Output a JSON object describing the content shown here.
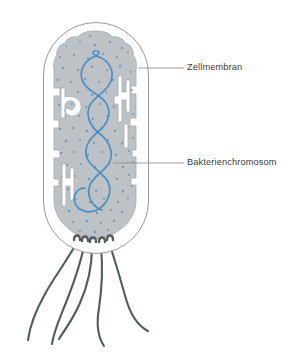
{
  "figure": {
    "type": "biological-diagram",
    "language": "de",
    "background_color": "#ffffff"
  },
  "colors": {
    "background": "#ffffff",
    "cell_wall_stroke": "#9a9a9a",
    "cell_wall_fill": "#ffffff",
    "cytoplasm_fill": "#bcc2c6",
    "cytoplasm_stroke": "#a8aeb2",
    "ribosome_dot": "#7e97ad",
    "membrane_invagination": "#ffffff",
    "membrane_invagination_stroke": "#a8aeb2",
    "chromosome_stroke": "#4a90c4",
    "flagella_stroke": "#555a5d",
    "leader_line": "#8c8c8c",
    "label_text": "#3b3b3b",
    "outer_glow": "#f0f0f0"
  },
  "labels": [
    {
      "id": "zellmembran",
      "text": "Zellmembran",
      "text_x": 187,
      "text_y": 68,
      "leader_from_x": 138,
      "leader_from_y": 68,
      "leader_to_x": 184,
      "leader_to_y": 68
    },
    {
      "id": "bakterienchromosom",
      "text": "Bakterienchromosom",
      "text_x": 187,
      "text_y": 163,
      "leader_from_x": 113,
      "leader_from_y": 163,
      "leader_to_x": 184,
      "leader_to_y": 163
    }
  ],
  "structures": {
    "cell_wall": {
      "name": "Zellwand",
      "x": 43,
      "y": 22,
      "width": 106,
      "height": 232,
      "corner_radius": 53
    },
    "cytoplasm": {
      "name": "Zytoplasma",
      "ribosome_count": 96
    },
    "chromosome": {
      "name": "Bakterienchromosom",
      "stroke_width": 1.7,
      "loops": 4
    },
    "flagella": {
      "name": "Geisseln",
      "count": 5,
      "stroke_width": 2.1
    },
    "membrane_invaginations": {
      "name": "Membraneinstuelpungen",
      "count": 3,
      "positions": [
        "links-oben",
        "rechts-oben",
        "links-unten"
      ]
    }
  }
}
